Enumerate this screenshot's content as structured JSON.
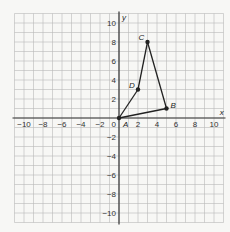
{
  "figure": {
    "type": "coordinate-plane",
    "x_axis_label": "x",
    "y_axis_label": "y",
    "x_range": [
      -11,
      11
    ],
    "y_range": [
      -11,
      11
    ],
    "x_ticks": [
      "−10",
      "−8",
      "−6",
      "−4",
      "−2",
      "2",
      "4",
      "6",
      "8",
      "10"
    ],
    "y_ticks": [
      "10",
      "8",
      "6",
      "4",
      "2",
      "−2",
      "−4",
      "−6",
      "−8",
      "−10"
    ],
    "origin_label": "0",
    "points": [
      {
        "name": "A",
        "x": 0,
        "y": 0
      },
      {
        "name": "B",
        "x": 5,
        "y": 1
      },
      {
        "name": "C",
        "x": 3,
        "y": 8
      },
      {
        "name": "D",
        "x": 2,
        "y": 3
      }
    ],
    "segments": [
      [
        "A",
        "B"
      ],
      [
        "B",
        "C"
      ],
      [
        "C",
        "D"
      ],
      [
        "D",
        "A"
      ]
    ],
    "colors": {
      "grid": "#b8b8b8",
      "axis": "#333333",
      "shape": "#222222",
      "background": "#f7f7f5"
    }
  }
}
